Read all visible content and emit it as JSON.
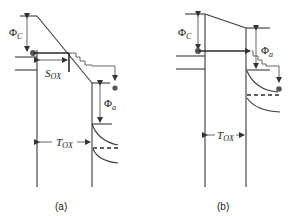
{
  "figure": {
    "panels": [
      {
        "id": "a",
        "label": "(a)",
        "labels": {
          "phi_c_main": "Φ",
          "phi_c_sub": "C",
          "s_ox_main": "S",
          "s_ox_sub": "OX",
          "phi_a_main": "Φ",
          "phi_a_sub": "a",
          "t_ox_main": "T",
          "t_ox_sub": "OX"
        }
      },
      {
        "id": "b",
        "label": "(b)",
        "labels": {
          "phi_c_main": "Φ",
          "phi_c_sub": "C",
          "phi_a_main": "Φ",
          "phi_a_sub": "a",
          "t_ox_main": "T",
          "t_ox_sub": "OX"
        }
      }
    ],
    "colors": {
      "line": "#3a3a3a",
      "dot": "#555555",
      "background": "#ffffff"
    }
  }
}
